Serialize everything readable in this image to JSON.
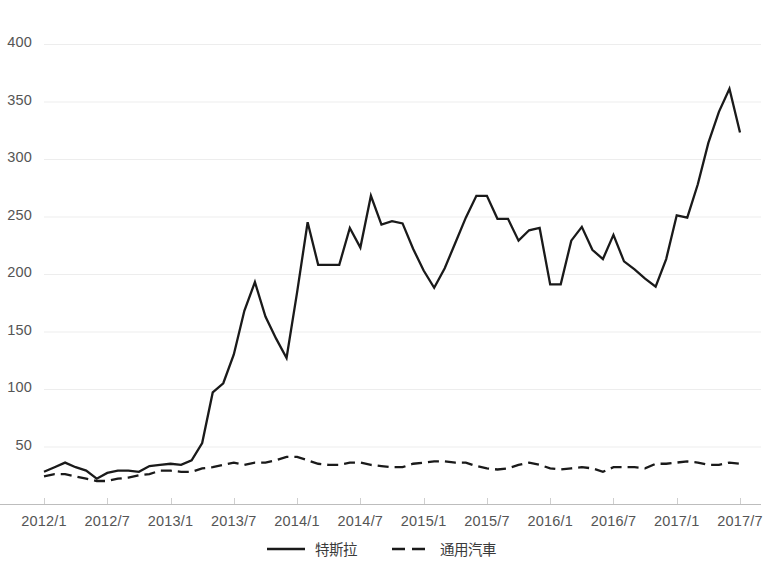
{
  "chart_data": {
    "type": "line",
    "title": "",
    "xlabel": "",
    "ylabel": "",
    "ylim": [
      0,
      400
    ],
    "yticks": [
      50,
      100,
      150,
      200,
      250,
      300,
      350,
      400
    ],
    "ytick_labels": [
      "50",
      "100",
      "150",
      "200",
      "250",
      "300",
      "350",
      "400"
    ],
    "grid": true,
    "legend_position": "bottom-center",
    "x": [
      "2012/1",
      "2012/2",
      "2012/3",
      "2012/4",
      "2012/5",
      "2012/6",
      "2012/7",
      "2012/8",
      "2012/9",
      "2012/10",
      "2012/11",
      "2012/12",
      "2013/1",
      "2013/2",
      "2013/3",
      "2013/4",
      "2013/5",
      "2013/6",
      "2013/7",
      "2013/8",
      "2013/9",
      "2013/10",
      "2013/11",
      "2013/12",
      "2014/1",
      "2014/2",
      "2014/3",
      "2014/4",
      "2014/5",
      "2014/6",
      "2014/7",
      "2014/8",
      "2014/9",
      "2014/10",
      "2014/11",
      "2014/12",
      "2015/1",
      "2015/2",
      "2015/3",
      "2015/4",
      "2015/5",
      "2015/6",
      "2015/7",
      "2015/8",
      "2015/9",
      "2015/10",
      "2015/11",
      "2015/12",
      "2016/1",
      "2016/2",
      "2016/3",
      "2016/4",
      "2016/5",
      "2016/6",
      "2016/7",
      "2016/8",
      "2016/9",
      "2016/10",
      "2016/11",
      "2016/12",
      "2017/1",
      "2017/2",
      "2017/3",
      "2017/4",
      "2017/5",
      "2017/6",
      "2017/7"
    ],
    "xtick_labels": [
      "2012/1",
      "2012/7",
      "2013/1",
      "2013/7",
      "2014/1",
      "2014/7",
      "2015/1",
      "2015/7",
      "2016/1",
      "2016/7",
      "2017/1",
      "2017/7"
    ],
    "xtick_indices": [
      0,
      6,
      12,
      18,
      24,
      30,
      36,
      42,
      48,
      54,
      60,
      66
    ],
    "series": [
      {
        "name": "特斯拉",
        "style": "solid",
        "color": "#1a1a1a",
        "values": [
          28,
          32,
          36,
          32,
          29,
          22,
          27,
          29,
          29,
          28,
          33,
          34,
          35,
          34,
          38,
          53,
          97,
          105,
          130,
          168,
          193,
          163,
          144,
          127,
          184,
          245,
          208,
          208,
          208,
          240,
          223,
          268,
          243,
          246,
          244,
          222,
          203,
          188,
          205,
          227,
          249,
          268,
          268,
          248,
          248,
          229,
          238,
          240,
          191,
          191,
          229,
          241,
          221,
          213,
          234,
          211,
          204,
          196,
          189,
          213,
          251,
          249,
          278,
          314,
          341,
          361,
          323
        ]
      },
      {
        "name": "通用汽車",
        "style": "dashed",
        "color": "#1a1a1a",
        "values": [
          24,
          26,
          26,
          24,
          22,
          20,
          20,
          22,
          23,
          25,
          26,
          29,
          29,
          28,
          28,
          31,
          32,
          34,
          36,
          34,
          36,
          36,
          38,
          41,
          41,
          38,
          35,
          34,
          34,
          36,
          36,
          34,
          33,
          32,
          32,
          35,
          36,
          37,
          37,
          36,
          36,
          33,
          31,
          30,
          31,
          34,
          36,
          34,
          31,
          30,
          31,
          32,
          31,
          28,
          32,
          32,
          32,
          31,
          35,
          35,
          36,
          37,
          36,
          34,
          34,
          36,
          35
        ]
      }
    ]
  },
  "axes": {
    "plot_left": 44,
    "plot_right": 740,
    "plot_top": 44,
    "plot_bottom": 504
  }
}
